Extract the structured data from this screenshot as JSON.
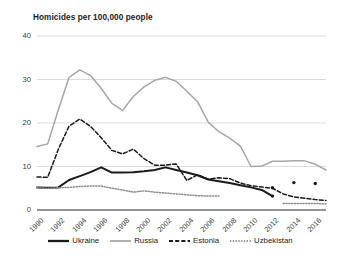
{
  "chart_data": {
    "type": "line",
    "title": "Homicides per 100,000 people",
    "xlabel": "",
    "ylabel": "",
    "ylim": [
      0,
      40
    ],
    "yticks": [
      0,
      10,
      20,
      30,
      40
    ],
    "xlim": [
      1990,
      2017
    ],
    "xticks": [
      1990,
      1992,
      1994,
      1996,
      1998,
      2000,
      2002,
      2004,
      2006,
      2008,
      2010,
      2012,
      2014,
      2016
    ],
    "grid": "horizontal",
    "legend_position": "bottom",
    "x": [
      1990,
      1991,
      1992,
      1993,
      1994,
      1995,
      1996,
      1997,
      1998,
      1999,
      2000,
      2001,
      2002,
      2003,
      2004,
      2005,
      2006,
      2007,
      2008,
      2009,
      2010,
      2011,
      2012,
      2013,
      2014,
      2015,
      2016,
      2017
    ],
    "series": [
      {
        "name": "Ukraine",
        "style": "solid",
        "color": "#1a1a1a",
        "width": 2.0,
        "values": [
          5.2,
          5.1,
          5.2,
          6.9,
          7.8,
          8.7,
          9.8,
          8.6,
          8.6,
          8.7,
          8.9,
          9.2,
          9.8,
          9.2,
          8.6,
          8.0,
          7.0,
          6.6,
          6.2,
          5.7,
          5.2,
          4.6,
          3.2,
          null,
          null,
          null,
          null,
          null
        ]
      },
      {
        "name": "Russia",
        "style": "solid",
        "color": "#a6a6a6",
        "width": 1.5,
        "values": [
          14.6,
          15.2,
          23.1,
          30.5,
          32.2,
          30.9,
          28.0,
          24.5,
          22.9,
          26.1,
          28.3,
          29.8,
          30.5,
          29.6,
          27.3,
          24.9,
          20.2,
          18.0,
          16.5,
          14.7,
          10.0,
          10.1,
          11.2,
          11.2,
          11.3,
          11.3,
          10.5,
          9.2
        ]
      },
      {
        "name": "Estonia",
        "style": "dashed",
        "color": "#1a1a1a",
        "width": 1.5,
        "values": [
          7.6,
          7.5,
          14.0,
          19.3,
          20.9,
          19.2,
          16.6,
          13.7,
          12.9,
          14.0,
          11.8,
          10.3,
          10.3,
          10.6,
          6.8,
          8.1,
          7.1,
          7.4,
          7.2,
          6.2,
          5.6,
          5.3,
          5.0,
          3.7,
          3.0,
          2.7,
          2.4,
          2.2
        ]
      },
      {
        "name": "Uzbekistan",
        "style": "dotted",
        "color": "#8c8c8c",
        "width": 1.5,
        "values": [
          5.1,
          5.0,
          5.1,
          5.2,
          5.4,
          5.5,
          5.5,
          5.0,
          4.6,
          4.1,
          4.4,
          4.1,
          3.9,
          3.7,
          3.5,
          3.3,
          3.2,
          3.2,
          null,
          null,
          null,
          null,
          null,
          1.5,
          1.5,
          1.5,
          1.5,
          1.4
        ]
      }
    ],
    "markers": [
      {
        "series": "Estonia",
        "x": 2012,
        "y": 5.1
      },
      {
        "series": "Ukraine",
        "x": 2012,
        "y": 3.2
      },
      {
        "series": "Ukraine",
        "x": 2014,
        "y": 6.3
      },
      {
        "series": "Ukraine",
        "x": 2016,
        "y": 6.1
      }
    ]
  },
  "legend": {
    "items": [
      {
        "label": "Ukraine"
      },
      {
        "label": "Russia"
      },
      {
        "label": "Estonia"
      },
      {
        "label": "Uzbekistan"
      }
    ]
  }
}
